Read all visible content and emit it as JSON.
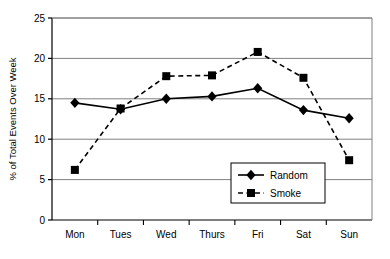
{
  "chart_data": {
    "type": "line",
    "title": "",
    "xlabel": "",
    "ylabel": "% of Total Events Over Week",
    "categories": [
      "Mon",
      "Tues",
      "Wed",
      "Thurs",
      "Fri",
      "Sat",
      "Sun"
    ],
    "ylim": [
      0,
      25
    ],
    "yticks": [
      0,
      5,
      10,
      15,
      20,
      25
    ],
    "ytick_labels": [
      "0",
      "5",
      "10",
      "15",
      "20",
      "25"
    ],
    "grid": "horizontal",
    "legend_position": "inside-bottom-right",
    "series": [
      {
        "name": "Random",
        "marker": "diamond",
        "line_style": "solid",
        "color": "#000000",
        "values": [
          14.5,
          13.7,
          15.0,
          15.3,
          16.3,
          13.6,
          12.6
        ]
      },
      {
        "name": "Smoke",
        "marker": "square",
        "line_style": "dashed",
        "color": "#000000",
        "values": [
          6.2,
          13.8,
          17.8,
          17.9,
          20.8,
          17.6,
          7.4
        ]
      }
    ]
  },
  "legend": {
    "entries": [
      {
        "label": "Random"
      },
      {
        "label": "Smoke"
      }
    ]
  }
}
